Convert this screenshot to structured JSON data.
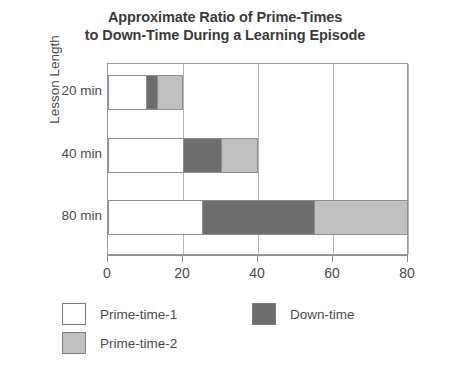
{
  "chart_data": {
    "type": "bar",
    "orientation": "horizontal",
    "stacked": true,
    "title": "Approximate Ratio of Prime-Times to Down-Time During a Learning Episode",
    "title_lines": [
      "Approximate Ratio of Prime-Times",
      "to Down-Time During a Learning Episode"
    ],
    "xlabel": "",
    "ylabel": "Lesson Length",
    "categories": [
      "20 min",
      "40 min",
      "80 min"
    ],
    "xlim": [
      0,
      80
    ],
    "xticks": [
      0,
      20,
      40,
      60,
      80
    ],
    "xtick_labels": [
      "0",
      "20",
      "40",
      "60",
      "80"
    ],
    "grid": "vertical",
    "legend_position": "bottom-left",
    "series": [
      {
        "name": "Prime-time-1",
        "color": "#ffffff",
        "values": [
          10,
          20,
          25
        ]
      },
      {
        "name": "Down-time",
        "color": "#6e6e6e",
        "values": [
          3,
          10,
          30
        ]
      },
      {
        "name": "Prime-time-2",
        "color": "#c0c0c0",
        "values": [
          7,
          10,
          25
        ]
      }
    ],
    "bar_totals": [
      20,
      40,
      80
    ]
  },
  "legend": {
    "entries": [
      {
        "label": "Prime-time-1",
        "color": "#ffffff"
      },
      {
        "label": "Down-time",
        "color": "#6e6e6e"
      },
      {
        "label": "Prime-time-2",
        "color": "#c0c0c0"
      }
    ]
  },
  "colors": {
    "prime_time_1": "#ffffff",
    "down_time": "#6e6e6e",
    "prime_time_2": "#c0c0c0",
    "axis": "#8f8f8f",
    "grid": "#b4b4b4",
    "text": "#4a4a4a",
    "background": "#ffffff"
  }
}
